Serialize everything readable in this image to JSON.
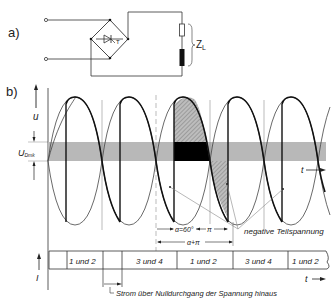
{
  "part_a": {
    "label": "a)",
    "load_label": "Z",
    "load_subscript": "L",
    "thyristor_label": "T"
  },
  "part_b": {
    "label": "b)",
    "voltage_axis_label": "u",
    "band_label": "U",
    "band_subscript": "Dmk",
    "time_axis_label": "t",
    "current_axis_label": "I",
    "alpha_label": "α=60°",
    "pi_label": "π",
    "alpha_pi_label": "α+π",
    "annotation_negative": "negative Teilspannung",
    "annotation_current": "Strom über Nulldurchgang der Spannung hinaus",
    "conduction_cells": [
      {
        "label": ""
      },
      {
        "label": "1 und 2"
      },
      {
        "label": ""
      },
      {
        "label": "3 und 4"
      },
      {
        "label": "1 und 2"
      },
      {
        "label": "3 und 4"
      },
      {
        "label": "1 und 2"
      }
    ]
  },
  "colors": {
    "line": "#1a1a1a",
    "band": "#b8b8b8",
    "dark": "#000000",
    "hatch": "#9a9a9a"
  }
}
